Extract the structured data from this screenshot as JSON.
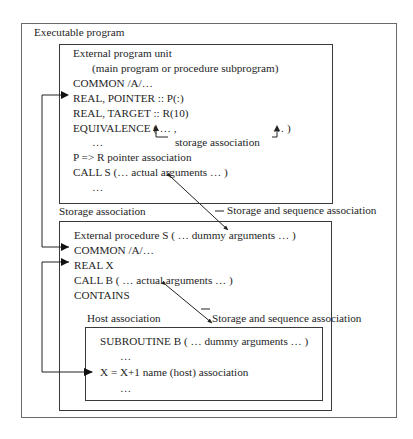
{
  "diagram": {
    "outer_title": "Executable program",
    "unit1": {
      "title": "External program unit",
      "subtitle": "(main program or procedure subprogram)",
      "lines": [
        "COMMON /A/…",
        "REAL, POINTER :: P(:)",
        "REAL, TARGET :: R(10)",
        "EQUIVALENCE ( … ,",
        "… )",
        "…",
        "storage association",
        "P => R  pointer association",
        "CALL S (…  actual arguments  … )",
        "…"
      ]
    },
    "label_storage_association": "Storage association",
    "label_storage_sequence_1": "Storage and sequence association",
    "unit2": {
      "lines": [
        "External procedure S ( … dummy arguments … )",
        "COMMON /A/…",
        "REAL X",
        "CALL B ( …  actual arguments  … )",
        "CONTAINS"
      ]
    },
    "label_host_association": "Host association",
    "label_storage_sequence_2": "Storage and sequence association",
    "unit3": {
      "lines": [
        "SUBROUTINE B ( … dummy arguments … )",
        "…",
        "X = X+1  name (host) association",
        "…"
      ]
    }
  }
}
